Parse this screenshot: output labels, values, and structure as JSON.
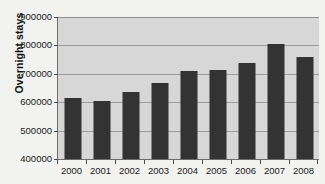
{
  "chart_data": {
    "type": "bar",
    "title": "",
    "xlabel": "",
    "ylabel": "Overnight stays",
    "categories": [
      "2000",
      "2001",
      "2002",
      "2003",
      "2004",
      "2005",
      "2006",
      "2007",
      "2008"
    ],
    "values": [
      615000,
      605000,
      636000,
      666000,
      711000,
      715000,
      737000,
      806000,
      758000
    ],
    "ylim": [
      400000,
      900000
    ],
    "ytick_labels": [
      "900000",
      "800000",
      "700000",
      "600000",
      "500000",
      "400000"
    ],
    "ytick_values": [
      900000,
      800000,
      700000,
      600000,
      500000,
      400000
    ],
    "grid": true,
    "legend": "none",
    "colors": {
      "bar": "#333333",
      "plot_background": "#d7d7d7",
      "page_background": "#f2f2f0",
      "gridline": "#9a9a9a",
      "axis": "#6d6d6d",
      "text": "#1a1a1a"
    }
  }
}
